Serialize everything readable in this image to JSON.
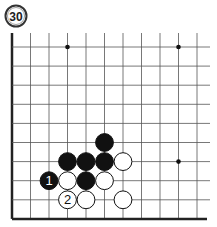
{
  "problem": {
    "number": "30"
  },
  "board": {
    "origin_x": 12,
    "origin_y": 47,
    "col_spacing": 18.5,
    "row_spacing": 19.1,
    "cols": 11,
    "rows": 10,
    "edges": {
      "left": true,
      "bottom": true,
      "top": false,
      "right": false
    },
    "line_color": "#555555",
    "edge_color": "#222222",
    "star_points": [
      {
        "col": 3,
        "row": 0
      },
      {
        "col": 9,
        "row": 0
      },
      {
        "col": 9,
        "row": 6
      }
    ]
  },
  "stones": [
    {
      "color": "black",
      "col": 5,
      "row": 5,
      "label": ""
    },
    {
      "color": "black",
      "col": 3,
      "row": 6,
      "label": ""
    },
    {
      "color": "black",
      "col": 4,
      "row": 6,
      "label": ""
    },
    {
      "color": "black",
      "col": 5,
      "row": 6,
      "label": ""
    },
    {
      "color": "white",
      "col": 6,
      "row": 6,
      "label": ""
    },
    {
      "color": "black",
      "col": 2,
      "row": 7,
      "label": "1"
    },
    {
      "color": "white",
      "col": 3,
      "row": 7,
      "label": ""
    },
    {
      "color": "black",
      "col": 4,
      "row": 7,
      "label": ""
    },
    {
      "color": "white",
      "col": 5,
      "row": 7,
      "label": ""
    },
    {
      "color": "white",
      "col": 3,
      "row": 8,
      "label": "2"
    },
    {
      "color": "white",
      "col": 4,
      "row": 8,
      "label": ""
    },
    {
      "color": "white",
      "col": 6,
      "row": 8,
      "label": ""
    }
  ]
}
